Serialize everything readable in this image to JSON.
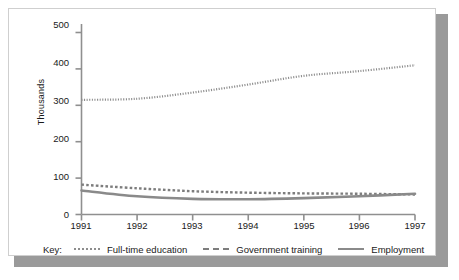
{
  "chart_data": {
    "type": "line",
    "title": "",
    "xlabel": "",
    "ylabel": "Thousands",
    "x": [
      1991,
      1992,
      1993,
      1994,
      1995,
      1996,
      1997
    ],
    "xticklabels": [
      "1991",
      "1992",
      "1993",
      "1994",
      "1995",
      "1996",
      "1997"
    ],
    "yticklabels": [
      "0",
      "100",
      "200",
      "300",
      "400",
      "500"
    ],
    "yticks": [
      0,
      100,
      200,
      300,
      400,
      500
    ],
    "ylim": [
      0,
      500
    ],
    "xlim": [
      1991,
      1997
    ],
    "grid": false,
    "legend_position": "bottom",
    "legend_prefix": "Key:",
    "series": [
      {
        "name": "Full-time education",
        "style": "dotted",
        "color": "#8d8d8d",
        "values": [
          315,
          318,
          335,
          357,
          381,
          394,
          410
        ]
      },
      {
        "name": "Government training",
        "style": "dashed",
        "color": "#7d7d7d",
        "values": [
          82,
          72,
          64,
          60,
          58,
          57,
          55
        ]
      },
      {
        "name": "Employment",
        "style": "solid",
        "color": "#8a8a8a",
        "values": [
          66,
          50,
          43,
          42,
          45,
          50,
          57
        ]
      }
    ]
  },
  "axis": {
    "y_label": "Thousands",
    "y_ticks": [
      "500",
      "400",
      "300",
      "200",
      "100",
      "0"
    ],
    "x_ticks": [
      "1991",
      "1992",
      "1993",
      "1994",
      "1995",
      "1996",
      "1997"
    ]
  },
  "legend": {
    "key_label": "Key:",
    "items": [
      {
        "label": "Full-time education",
        "style": "dotted"
      },
      {
        "label": "Government training",
        "style": "dashed"
      },
      {
        "label": "Employment",
        "style": "solid"
      }
    ]
  },
  "colors": {
    "axis": "#8f8f8f",
    "text": "#1a1a1a",
    "card_border": "#cfcfcf",
    "shadow": "#9a9a9a",
    "full_time_education": "#8d8d8d",
    "government_training": "#7d7d7d",
    "employment": "#8a8a8a"
  }
}
